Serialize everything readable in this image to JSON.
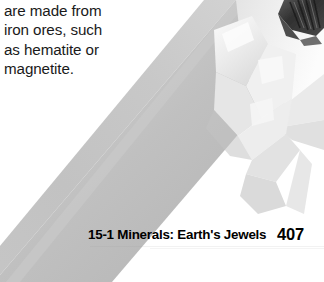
{
  "page": {
    "background_color": "#ffffff",
    "width": 324,
    "height": 282
  },
  "body_text": {
    "lines": [
      "are made from",
      "iron ores, such",
      "as hematite or",
      "magnetite."
    ],
    "color": "#1a1a1a"
  },
  "figure": {
    "caption": "",
    "colors": {
      "body_gray": "#bfbfbf",
      "body_gray_light": "#cfcfcf",
      "body_gray_dark": "#a9a9a9",
      "facet_white": "#f2f2f2",
      "facet_highlight": "#fafafa",
      "facet_shadow": "#d6d6d6",
      "tip_dark": "#3a3a3a",
      "tip_darker": "#222222",
      "tip_mid": "#6b6b6b"
    }
  },
  "footer": {
    "section_label": "15-1 Minerals: Earth's Jewels",
    "page_number": "407",
    "color": "#000000"
  }
}
